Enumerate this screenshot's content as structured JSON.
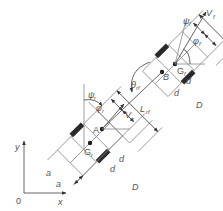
{
  "diagram": {
    "type": "kinematic schematic of articulated two-module tracked vehicle",
    "axes": {
      "origin_label": "0",
      "x_label": "x",
      "y_label": "y"
    },
    "points": {
      "front_hitch": "B",
      "rear_hitch": "A",
      "front_center": "G",
      "front_center_sub": "f",
      "rear_center": "G",
      "rear_center_sub": "r"
    },
    "velocities": {
      "front": "V",
      "front_sub": "f",
      "rear": "V",
      "rear_sub": "r"
    },
    "angles": {
      "front_heading": "φ",
      "front_heading_sub": "f",
      "front_slip": "ψ",
      "front_slip_sub": "f",
      "rear_heading": "φ",
      "rear_heading_sub": "r",
      "rear_slip": "ψ",
      "rear_slip_sub": "r",
      "articulation": "θ",
      "articulation_sub": "rf"
    },
    "link_length": "L",
    "link_length_sub": "rf",
    "dimensions": {
      "rear_offset": "a",
      "front_half_track": "d",
      "rear_half_track": "d",
      "front_width": "D",
      "rear_width": "D"
    }
  }
}
